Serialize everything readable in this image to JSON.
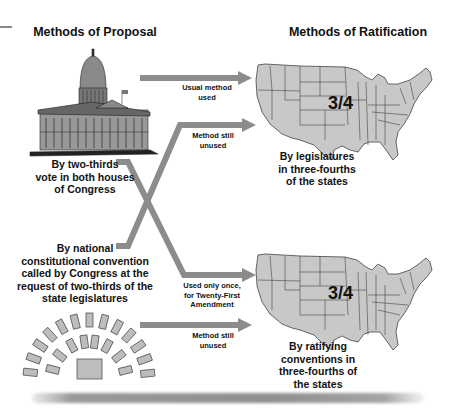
{
  "headings": {
    "proposal": "Methods of Proposal",
    "ratification": "Methods of Ratification"
  },
  "proposal_methods": [
    {
      "lines": [
        "By two-thirds",
        "vote in both houses",
        "of Congress"
      ],
      "icon": "capitol-building-icon"
    },
    {
      "lines": [
        "By national",
        "constitutional convention",
        "called by Congress at the",
        "request of two-thirds of the",
        "state legislatures"
      ],
      "icon": "convention-seating-icon"
    }
  ],
  "ratification_methods": [
    {
      "lines": [
        "By legislatures",
        "in three-fourths",
        "of the states"
      ],
      "fraction": "3/4",
      "icon": "us-map-icon"
    },
    {
      "lines": [
        "By ratifying",
        "conventions in",
        "three-fourths of",
        "the states"
      ],
      "fraction": "3/4",
      "icon": "us-map-icon"
    }
  ],
  "arrows": [
    {
      "from": "congress",
      "to": "legislatures",
      "lines": [
        "Usual method",
        "used"
      ]
    },
    {
      "from": "convention",
      "to": "legislatures",
      "lines": [
        "Method still",
        "unused"
      ]
    },
    {
      "from": "congress",
      "to": "conventions",
      "lines": [
        "Used only once,",
        "for Twenty-First",
        "Amendment"
      ]
    },
    {
      "from": "convention",
      "to": "conventions",
      "lines": [
        "Method still",
        "unused"
      ]
    }
  ],
  "colors": {
    "arrow": "#8c8c8c",
    "map_fill": "#c8c8c8",
    "map_stroke": "#444444",
    "seat_fill": "#bdbdbd"
  }
}
